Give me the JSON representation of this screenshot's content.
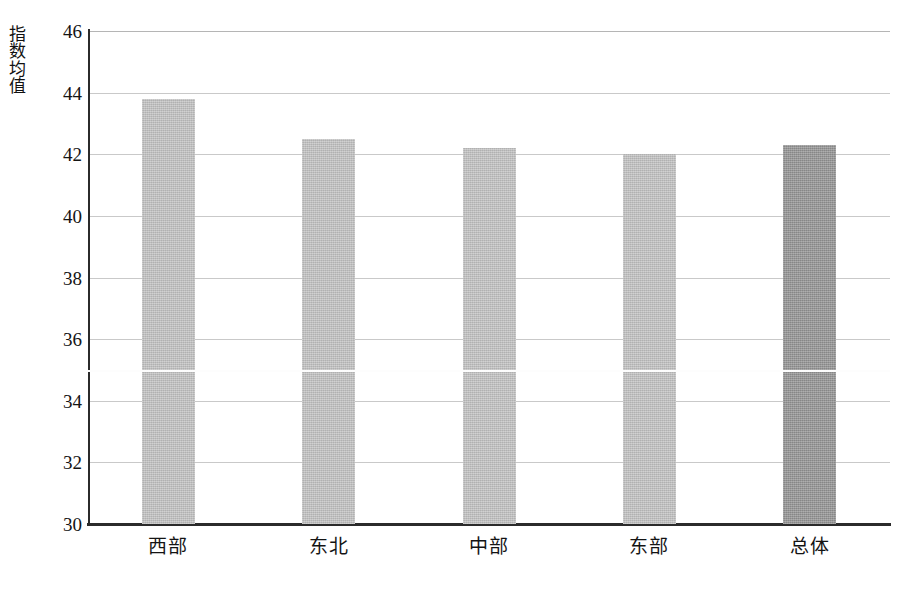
{
  "chart_data": {
    "type": "bar",
    "title": "",
    "subtitle": "",
    "xlabel": "",
    "ylabel": "指数均值",
    "categories": [
      "西部",
      "东北",
      "中部",
      "东部",
      "总体"
    ],
    "values": [
      43.8,
      42.5,
      42.2,
      42.0,
      42.3
    ],
    "series": [
      {
        "name": "指数均值",
        "values": [
          43.8,
          42.5,
          42.2,
          42.0,
          42.3
        ]
      }
    ],
    "ylim": [
      30,
      46
    ],
    "yticks": [
      30,
      32,
      34,
      36,
      38,
      40,
      42,
      44,
      46
    ],
    "ytick_labels": [
      "30",
      "32",
      "34",
      "36",
      "38",
      "40",
      "42",
      "44",
      "46"
    ],
    "grid": true,
    "grid_axis": "y",
    "legend": false,
    "legend_position": "none",
    "bar_colors": [
      "#c2c2c2",
      "#c2c2c2",
      "#c2c2c2",
      "#c2c2c2",
      "#949494"
    ],
    "highlight_index": 4,
    "annotations": []
  },
  "colors": {
    "bar_default": "#c2c2c2",
    "bar_highlight": "#949494",
    "axis": "#2b2b2b",
    "gridline": "#c9c9c9",
    "text": "#141414",
    "background": "#ffffff"
  },
  "axis": {
    "y_title_chars": [
      "指",
      "数",
      "均",
      "值"
    ]
  }
}
